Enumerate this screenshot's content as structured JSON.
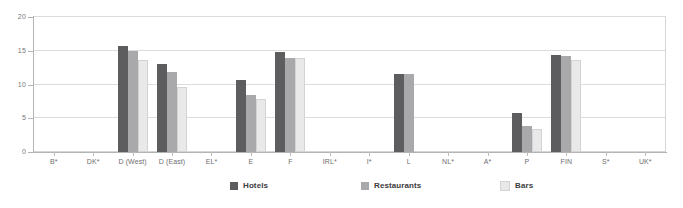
{
  "chart_data": {
    "type": "bar",
    "title": "",
    "subtitle": "",
    "xlabel": "",
    "ylabel": "",
    "ylim": [
      0,
      20
    ],
    "yticks": [
      0,
      5,
      10,
      15,
      20
    ],
    "grid": true,
    "legend_position": "bottom",
    "categories": [
      "B*",
      "DK*",
      "D (West)",
      "D (East)",
      "EL*",
      "E",
      "F",
      "IRL*",
      "I*",
      "L",
      "NL*",
      "A*",
      "P",
      "FIN",
      "S*",
      "UK*"
    ],
    "series": [
      {
        "name": "Hotels",
        "color": "#5d5d5f",
        "values": [
          null,
          null,
          15.7,
          13.1,
          null,
          10.6,
          14.8,
          null,
          null,
          11.6,
          null,
          null,
          5.8,
          14.3,
          null,
          null
        ]
      },
      {
        "name": "Restaurants",
        "color": "#a9a9ab",
        "values": [
          null,
          null,
          15.0,
          11.9,
          null,
          8.5,
          14.0,
          null,
          null,
          11.6,
          null,
          null,
          3.9,
          14.2,
          null,
          null
        ]
      },
      {
        "name": "Bars",
        "color": "#e9e9e9",
        "values": [
          null,
          null,
          13.6,
          9.6,
          null,
          7.9,
          14.0,
          null,
          null,
          null,
          null,
          null,
          3.4,
          13.7,
          null,
          null
        ]
      }
    ]
  },
  "axes": {
    "y_tick_labels": [
      "0",
      "5",
      "10",
      "15",
      "20"
    ]
  },
  "legend": {
    "items": [
      {
        "label": "Hotels",
        "color": "#5d5d5f"
      },
      {
        "label": "Restaurants",
        "color": "#a9a9ab"
      },
      {
        "label": "Bars",
        "color": "#e9e9e9"
      }
    ]
  }
}
